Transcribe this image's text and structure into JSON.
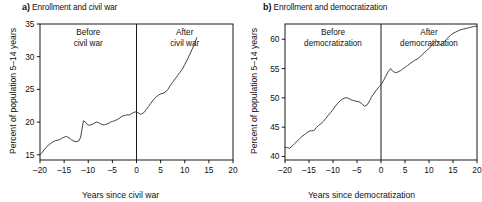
{
  "figure": {
    "width": 482,
    "height": 202,
    "background": "#ffffff",
    "line_color": "#3a3a3a",
    "axis_color": "#000000"
  },
  "panels": [
    {
      "letter": "a)",
      "title": "Enrollment and civil war",
      "ylabel": "Percent of population 5–14 years",
      "xlabel": "Years since civil war",
      "annotation_before": [
        "Before",
        "civil war"
      ],
      "annotation_after": [
        "After",
        "civil war"
      ],
      "yticks": [
        15,
        20,
        25,
        30,
        35
      ],
      "xticks": [
        -20,
        -15,
        -10,
        -5,
        0,
        5,
        10,
        15,
        20
      ],
      "xticklabels": [
        "–20",
        "–15",
        "–10",
        "–5",
        "0",
        "5",
        "10",
        "15",
        "20"
      ],
      "yticklabels": [
        "15",
        "20",
        "25",
        "30",
        "35"
      ]
    },
    {
      "letter": "b)",
      "title": "Enrollment and democratization",
      "ylabel": "Percent of population 5–14 years",
      "xlabel": "Years since democratization",
      "annotation_before": [
        "Before",
        "democratization"
      ],
      "annotation_after": [
        "After",
        "democratization"
      ],
      "yticks": [
        40,
        45,
        50,
        55,
        60
      ],
      "xticks": [
        -20,
        -15,
        -10,
        -5,
        0,
        5,
        10,
        15,
        20
      ],
      "xticklabels": [
        "–20",
        "–15",
        "–10",
        "–5",
        "0",
        "5",
        "10",
        "15",
        "20"
      ],
      "yticklabels": [
        "40",
        "45",
        "50",
        "55",
        "60"
      ]
    }
  ],
  "chart_data": [
    {
      "type": "line",
      "title": "Enrollment and civil war",
      "xlabel": "Years since civil war",
      "ylabel": "Percent of population 5–14 years",
      "xlim": [
        -20,
        20
      ],
      "ylim": [
        14.2,
        35
      ],
      "grid": false,
      "legend": null,
      "annotations": [
        {
          "text": "Before civil war",
          "x": -10,
          "y": 34
        },
        {
          "text": "After civil war",
          "x": 5,
          "y": 34
        },
        {
          "text": "vertical reference line",
          "x": 0
        }
      ],
      "reference_line_x": 0,
      "series": [
        {
          "name": "Percent enrolled 5-14 years",
          "x": [
            -20,
            -19.5,
            -19,
            -18.5,
            -18,
            -17.5,
            -17,
            -16.5,
            -16,
            -15.5,
            -15,
            -14.5,
            -14,
            -13.5,
            -13,
            -12.5,
            -12,
            -11.6,
            -11.3,
            -11,
            -10.6,
            -10.2,
            -9.8,
            -9.4,
            -9,
            -8.6,
            -8.2,
            -7.8,
            -7.4,
            -7,
            -6.6,
            -6.2,
            -5.8,
            -5.4,
            -5,
            -4.5,
            -4,
            -3.5,
            -3,
            -2.5,
            -2,
            -1.5,
            -1,
            -0.5,
            0,
            0.4,
            0.8,
            1.2,
            1.6,
            2,
            2.5,
            3,
            3.5,
            4,
            4.5,
            5,
            5.5,
            6,
            6.5,
            7,
            7.5,
            8,
            8.5,
            9,
            9.5,
            10,
            10.5,
            11,
            11.5,
            12,
            12.5
          ],
          "y": [
            15.0,
            15.4,
            15.9,
            16.3,
            16.6,
            16.9,
            17.1,
            17.2,
            17.3,
            17.5,
            17.7,
            17.8,
            17.6,
            17.3,
            17.1,
            17.0,
            17.1,
            17.6,
            18.9,
            20.2,
            20.0,
            19.6,
            19.5,
            19.6,
            19.7,
            19.9,
            20.0,
            19.9,
            19.7,
            19.6,
            19.6,
            19.7,
            19.8,
            20.0,
            20.1,
            20.2,
            20.4,
            20.6,
            20.9,
            21.0,
            21.1,
            21.1,
            21.3,
            21.5,
            21.6,
            21.4,
            21.2,
            21.3,
            21.5,
            21.9,
            22.4,
            22.9,
            23.4,
            23.8,
            24.1,
            24.3,
            24.4,
            24.6,
            25.0,
            25.6,
            26.1,
            26.6,
            27.1,
            27.6,
            28.1,
            28.8,
            29.5,
            30.3,
            31.1,
            31.9,
            32.9
          ]
        }
      ]
    },
    {
      "type": "line",
      "title": "Enrollment and democratization",
      "xlabel": "Years since democratization",
      "ylabel": "Percent of population 5–14 years",
      "xlim": [
        -20,
        20
      ],
      "ylim": [
        39.4,
        62.6
      ],
      "grid": false,
      "legend": null,
      "annotations": [
        {
          "text": "Before democratization",
          "x": -10,
          "y": 61
        },
        {
          "text": "After democratization",
          "x": 8,
          "y": 61
        },
        {
          "text": "vertical reference line",
          "x": 0
        }
      ],
      "reference_line_x": 0,
      "series": [
        {
          "name": "Percent enrolled 5-14 years",
          "x": [
            -20,
            -19.5,
            -19,
            -18.5,
            -18,
            -17.5,
            -17,
            -16.5,
            -16,
            -15.5,
            -15,
            -14.5,
            -14,
            -13.5,
            -13,
            -12.5,
            -12,
            -11.5,
            -11,
            -10.5,
            -10,
            -9.5,
            -9,
            -8.5,
            -8,
            -7.5,
            -7,
            -6.5,
            -6,
            -5.5,
            -5,
            -4.5,
            -4,
            -3.5,
            -3,
            -2.5,
            -2,
            -1.5,
            -1,
            -0.5,
            0,
            0.5,
            1,
            1.5,
            2,
            2.5,
            3,
            3.5,
            4,
            4.5,
            5,
            5.5,
            6,
            6.5,
            7,
            7.5,
            8,
            8.5,
            9,
            9.5,
            10,
            10.5,
            11,
            11.5,
            12,
            12.5,
            13,
            13.5,
            14,
            14.5,
            15,
            15.5,
            16,
            16.5,
            17,
            17.5,
            18,
            18.5,
            19,
            19.5,
            20
          ],
          "y": [
            41.6,
            41.5,
            41.4,
            41.8,
            42.2,
            42.6,
            43.0,
            43.4,
            43.7,
            44.0,
            44.3,
            44.4,
            44.4,
            44.9,
            45.3,
            45.6,
            46.0,
            46.5,
            47.0,
            47.5,
            48.0,
            48.6,
            49.1,
            49.5,
            49.8,
            50.0,
            50.0,
            49.8,
            49.6,
            49.5,
            49.4,
            49.3,
            49.0,
            48.6,
            48.7,
            49.3,
            50.1,
            50.7,
            51.3,
            51.8,
            52.2,
            52.9,
            53.7,
            54.5,
            55.0,
            54.5,
            54.3,
            54.4,
            54.6,
            54.9,
            55.2,
            55.5,
            55.8,
            56.1,
            56.4,
            56.6,
            56.9,
            57.3,
            57.7,
            58.1,
            58.4,
            58.9,
            59.4,
            59.8,
            59.3,
            59.0,
            59.4,
            59.9,
            60.3,
            60.7,
            61.0,
            61.2,
            61.4,
            61.6,
            61.7,
            61.8,
            61.9,
            62.0,
            62.1,
            62.2,
            62.2
          ]
        }
      ]
    }
  ]
}
